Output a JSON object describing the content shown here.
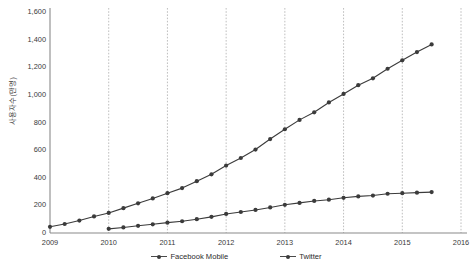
{
  "chart_data": {
    "type": "line",
    "title": "",
    "xlabel": "",
    "ylabel": "사용자수(만명)",
    "xlim": [
      2009,
      2016
    ],
    "ylim": [
      0,
      1600
    ],
    "grid": "vertical-dotted-yearly",
    "legend_position": "bottom-center",
    "x_ticks": [
      "2009",
      "2010",
      "2011",
      "2012",
      "2013",
      "2014",
      "2015",
      "2016"
    ],
    "y_ticks": [
      "0",
      "200",
      "400",
      "600",
      "800",
      "1,000",
      "1,200",
      "1,400",
      "1,600"
    ],
    "x_tick_values": [
      2009,
      2010,
      2011,
      2012,
      2013,
      2014,
      2015,
      2016
    ],
    "y_tick_values": [
      0,
      200,
      400,
      600,
      800,
      1000,
      1200,
      1400,
      1600
    ],
    "series": [
      {
        "name": "Facebook Mobile",
        "color": "#3b3b3b",
        "marker": "circle",
        "x": [
          2009.0,
          2009.25,
          2009.5,
          2009.75,
          2010.0,
          2010.25,
          2010.5,
          2010.75,
          2011.0,
          2011.25,
          2011.5,
          2011.75,
          2012.0,
          2012.25,
          2012.5,
          2012.75,
          2013.0,
          2013.25,
          2013.5,
          2013.75,
          2014.0,
          2014.25,
          2014.5,
          2014.75,
          2015.0,
          2015.25,
          2015.5
        ],
        "values": [
          45,
          65,
          90,
          120,
          145,
          180,
          215,
          250,
          288,
          325,
          375,
          425,
          488,
          543,
          604,
          680,
          751,
          819,
          874,
          945,
          1007,
          1070,
          1120,
          1189,
          1250,
          1310,
          1365
        ]
      },
      {
        "name": "Twitter",
        "color": "#3b3b3b",
        "marker": "circle",
        "x": [
          2010.0,
          2010.25,
          2010.5,
          2010.75,
          2011.0,
          2011.25,
          2011.5,
          2011.75,
          2012.0,
          2012.25,
          2012.5,
          2012.75,
          2013.0,
          2013.25,
          2013.5,
          2013.75,
          2014.0,
          2014.25,
          2014.5,
          2014.75,
          2015.0,
          2015.25,
          2015.5
        ],
        "values": [
          30,
          40,
          52,
          63,
          75,
          85,
          100,
          117,
          138,
          152,
          167,
          185,
          204,
          218,
          232,
          241,
          255,
          265,
          271,
          284,
          288,
          292,
          296
        ]
      }
    ]
  },
  "legend": {
    "items": [
      {
        "label": "Facebook Mobile"
      },
      {
        "label": "Twitter"
      }
    ]
  },
  "axes": {
    "y_axis_title": "사용자수(만명)"
  }
}
